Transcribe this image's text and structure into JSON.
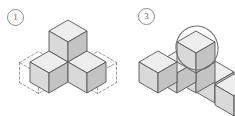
{
  "page": {
    "background_color": "#ffffff",
    "width": 235,
    "height": 116
  },
  "palette": {
    "face_top": "#eeeeee",
    "face_left": "#d9d9d9",
    "face_right": "#c3c3c3",
    "face_top_alt": "#f2f2f2",
    "outline": "#555555",
    "outline_light": "#777777",
    "dashed_outline": "#8a8a8a",
    "label_text": "#6a6a6a",
    "label_border": "#8d8d8d",
    "annotation_circle": "#6f6f6f"
  },
  "figures": [
    {
      "id": "figure-1",
      "label": "1",
      "label_name": "step-label-1",
      "caption": "",
      "solid_cube_count": 4,
      "ghost_cube_count": 2,
      "annotation": "none",
      "notes": "Four solid cubes: one stacked on top of a centre cube, with cubes extending front-left and front-right. Dashed wireframe cubes outline empty positions at far left and far right."
    },
    {
      "id": "figure-3",
      "label": "3",
      "label_name": "step-label-3",
      "caption": "",
      "solid_cube_count": 6,
      "ghost_cube_count": 0,
      "annotation": "ellipse-highlight-on-top-cube",
      "notes": "A row of two cubes extends front-left from a centre cube, one cube is stacked on top of the centre cube and is circled by a hand-drawn ellipse, and further cubes extend front-right past the image edge."
    }
  ]
}
